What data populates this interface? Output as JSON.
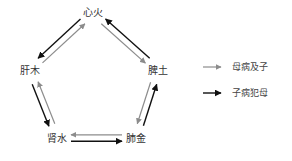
{
  "diagram": {
    "title": "",
    "nodes": [
      {
        "id": "heart",
        "label": "心火"
      },
      {
        "id": "spleen",
        "label": "脾土"
      },
      {
        "id": "lung",
        "label": "肺金"
      },
      {
        "id": "kidney",
        "label": "肾水"
      },
      {
        "id": "liver",
        "label": "肝木"
      }
    ],
    "edges": [
      {
        "from": "liver",
        "to": "heart",
        "type": "mother_to_child"
      },
      {
        "from": "heart",
        "to": "spleen",
        "type": "mother_to_child"
      },
      {
        "from": "spleen",
        "to": "lung",
        "type": "mother_to_child"
      },
      {
        "from": "lung",
        "to": "kidney",
        "type": "mother_to_child"
      },
      {
        "from": "kidney",
        "to": "liver",
        "type": "mother_to_child"
      },
      {
        "from": "heart",
        "to": "liver",
        "type": "child_to_mother"
      },
      {
        "from": "spleen",
        "to": "heart",
        "type": "child_to_mother"
      },
      {
        "from": "lung",
        "to": "spleen",
        "type": "child_to_mother"
      },
      {
        "from": "kidney",
        "to": "lung",
        "type": "child_to_mother"
      },
      {
        "from": "liver",
        "to": "kidney",
        "type": "child_to_mother"
      }
    ],
    "legend": [
      {
        "type": "mother_to_child",
        "label": "母病及子",
        "color": "#8c8c8c"
      },
      {
        "type": "child_to_mother",
        "label": "子病犯母",
        "color": "#111111"
      }
    ]
  }
}
